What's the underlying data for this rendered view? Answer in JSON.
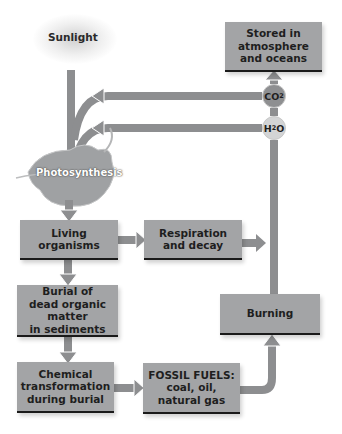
{
  "nodes": {
    "sunlight": "Sunlight",
    "photosynthesis": "Photosynthesis",
    "stored": [
      "Stored in",
      "atmosphere",
      "and oceans"
    ],
    "living": [
      "Living",
      "organisms"
    ],
    "respiration": [
      "Respiration",
      "and decay"
    ],
    "burial": [
      "Burial of",
      "dead organic matter",
      "in sediments"
    ],
    "chemical": [
      "Chemical",
      "transformation",
      "during burial"
    ],
    "fossil": [
      "FOSSIL FUELS:",
      "coal, oil,",
      "natural gas"
    ],
    "burning": [
      "Burning"
    ]
  },
  "molecules": {
    "co2": {
      "base": "CO",
      "sub": "2",
      "color": "#8e8f91"
    },
    "h2o": {
      "base": "H",
      "sub": "2",
      "tail": "O",
      "color": "#d3d4d5"
    }
  },
  "colors": {
    "box": "#a3a4a6",
    "arrow": "#8d8e90",
    "leaf": "#9fa1a3"
  }
}
